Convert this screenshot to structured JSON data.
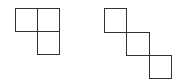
{
  "diagram": {
    "stroke_color": "#333333",
    "background": "#ffffff",
    "shapes": [
      {
        "name": "l-tromino",
        "squares": [
          {
            "x": 15,
            "y": 8,
            "size": 23
          },
          {
            "x": 37,
            "y": 8,
            "size": 23
          },
          {
            "x": 37,
            "y": 31,
            "size": 23
          }
        ]
      },
      {
        "name": "diagonal-staircase",
        "squares": [
          {
            "x": 104,
            "y": 8,
            "size": 23
          },
          {
            "x": 126,
            "y": 32,
            "size": 23
          },
          {
            "x": 149,
            "y": 55,
            "size": 23
          }
        ]
      }
    ]
  }
}
